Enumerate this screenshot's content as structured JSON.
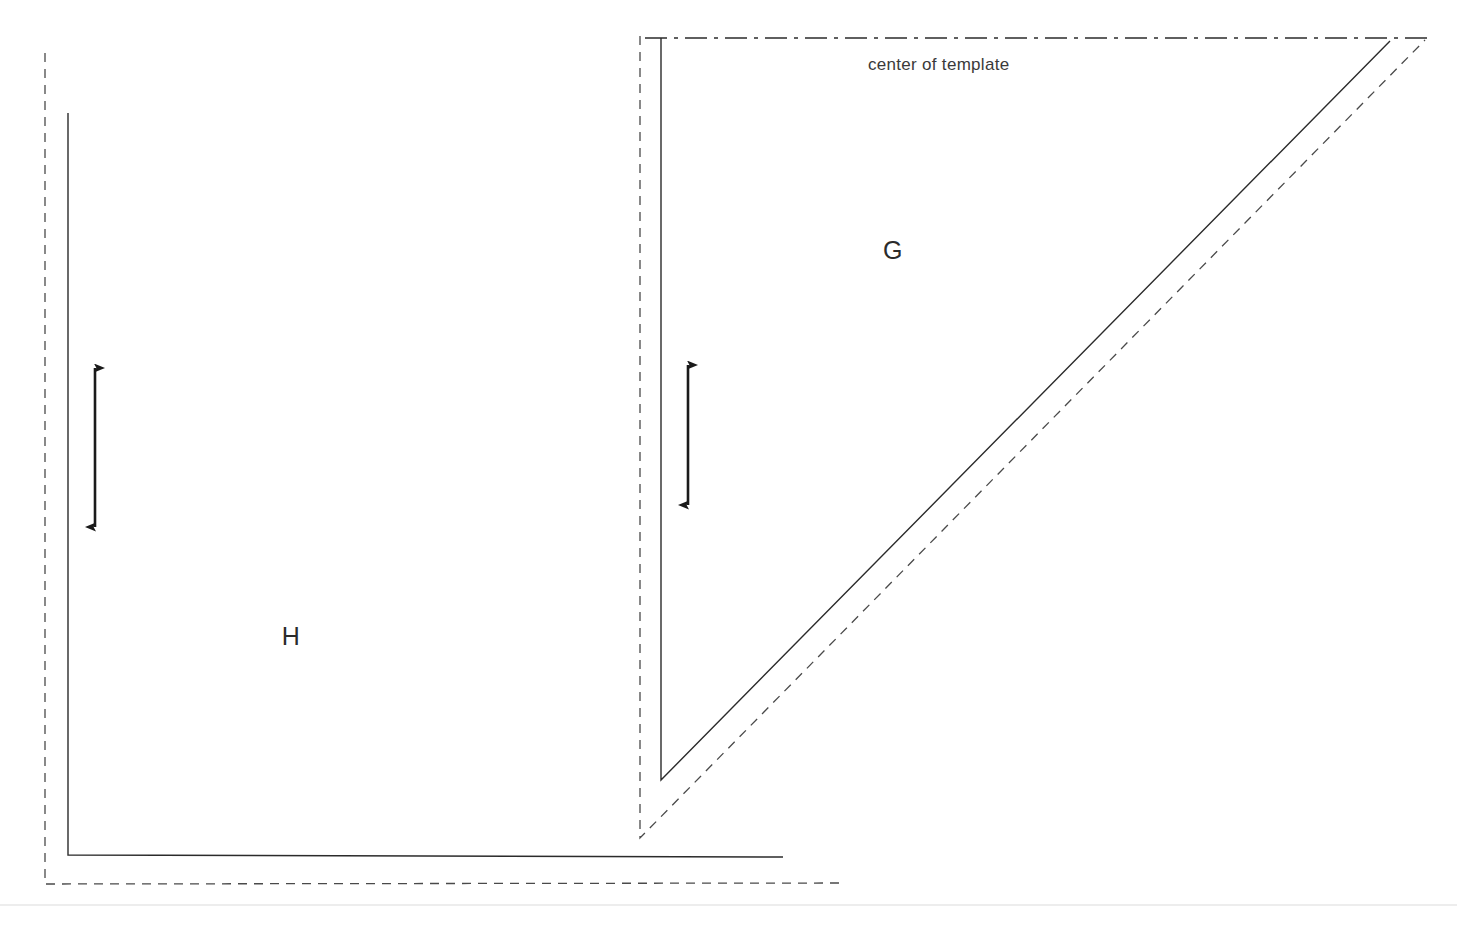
{
  "canvas": {
    "width": 1457,
    "height": 925,
    "background": "#ffffff"
  },
  "colors": {
    "cut_line": "#2b2b2b",
    "seam_line": "#4a4a4a",
    "center_line": "#2b2b2b",
    "grainline_arrow": "#1a1a1a",
    "label_text": "#2b2b2b",
    "annotation_text": "#3a3a3a",
    "page_edge": "#ededed"
  },
  "labels": {
    "piece_g": "G",
    "piece_h": "H",
    "center_of_template": "center of template"
  },
  "pieces": [
    {
      "id": "piece-h",
      "label": "H",
      "label_position": {
        "x": 291,
        "y": 645
      },
      "cut_line_points": "68,113 68,855 783,857",
      "seam_line_points": "45,53 45,884 840,883",
      "grainline": {
        "x": 95,
        "y_top": 365,
        "y_bottom": 530
      }
    },
    {
      "id": "piece-g",
      "label": "G",
      "label_position": {
        "x": 893,
        "y": 259
      },
      "cut_line_points": "661,38 661,780 1390,41",
      "seam_line_points": "640,36 640,838 1425,40",
      "grainline": {
        "x": 688,
        "y_top": 362,
        "y_bottom": 508
      }
    }
  ],
  "center_line": {
    "label": "center of template",
    "label_position": {
      "x": 868,
      "y": 70
    },
    "x_start": 645,
    "x_end": 1428,
    "y": 38,
    "dash_pattern": "22 7 4 7"
  },
  "page_edge_rule": {
    "y": 905,
    "x_start": 0,
    "x_end": 1457
  },
  "line_styles": {
    "cut_line_dash": "none",
    "seam_line_dash": "9 7",
    "cut_line_width": 1.4,
    "seam_line_width": 1.3,
    "center_line_width": 1.3,
    "grainline_width": 2.6
  }
}
